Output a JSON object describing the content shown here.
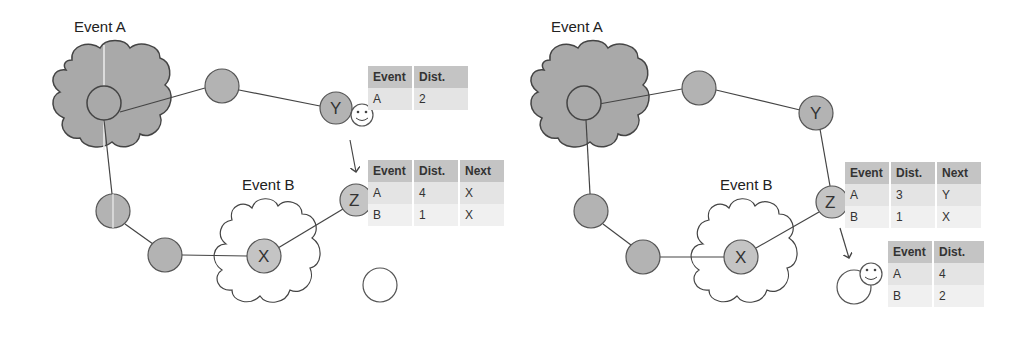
{
  "left_panel": {
    "event_a_label": "Event A",
    "event_b_label": "Event B",
    "nodes": {
      "y": "Y",
      "z": "Z",
      "x": "X"
    },
    "table_y": {
      "headers": [
        "Event",
        "Dist."
      ],
      "rows": [
        [
          "A",
          "2"
        ]
      ]
    },
    "table_z": {
      "headers": [
        "Event",
        "Dist.",
        "Next"
      ],
      "rows": [
        [
          "A",
          "4",
          "X"
        ],
        [
          "B",
          "1",
          "X"
        ]
      ]
    }
  },
  "right_panel": {
    "event_a_label": "Event A",
    "event_b_label": "Event B",
    "nodes": {
      "y": "Y",
      "z": "Z",
      "x": "X"
    },
    "table_z": {
      "headers": [
        "Event",
        "Dist.",
        "Next"
      ],
      "rows": [
        [
          "A",
          "3",
          "Y"
        ],
        [
          "B",
          "1",
          "X"
        ]
      ]
    },
    "table_agent": {
      "headers": [
        "Event",
        "Dist."
      ],
      "rows": [
        [
          "A",
          "4"
        ],
        [
          "B",
          "2"
        ]
      ]
    }
  },
  "colors": {
    "node_fill": "#b3b3b3",
    "cloud_a_fill": "#a9a9a9",
    "cloud_b_fill": "#ffffff",
    "stroke": "#444444"
  }
}
